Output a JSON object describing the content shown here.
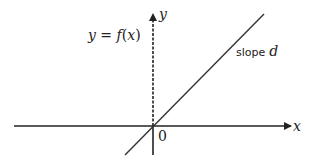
{
  "diagram": {
    "function_label": "y = f(x)",
    "function_label_parts": {
      "y": "y",
      "eq": " = ",
      "f": "f",
      "open": "(",
      "x": "x",
      "close": ")"
    },
    "slope_label": "slope",
    "slope_var": "d",
    "x_axis_label": "x",
    "y_axis_label": "y",
    "origin_label": "0",
    "colors": {
      "axis": "#222222",
      "line": "#333333",
      "background": "#ffffff"
    }
  }
}
